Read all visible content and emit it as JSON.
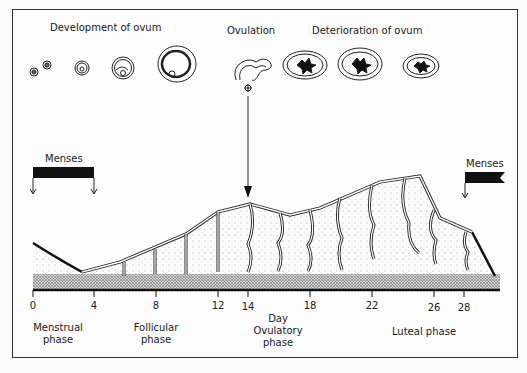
{
  "header_labels": {
    "development": "Development of ovum",
    "ovulation": "Ovulation",
    "deterioration": "Deterioration of ovum"
  },
  "menses": {
    "left_label": "Menses",
    "right_label": "Menses"
  },
  "axis": {
    "title": "Day",
    "ticks": [
      "0",
      "4",
      "8",
      "12",
      "14",
      "18",
      "22",
      "26",
      "28"
    ]
  },
  "phases": {
    "menstrual": [
      "Menstrual",
      "phase"
    ],
    "follicular": [
      "Follicular",
      "phase"
    ],
    "ovulatory": [
      "Ovulatory",
      "phase"
    ],
    "luteal": "Luteal phase"
  },
  "colors": {
    "ink": "#1a1a1a",
    "background": "#fcfcfc",
    "stipple": "#9a9a9a"
  }
}
